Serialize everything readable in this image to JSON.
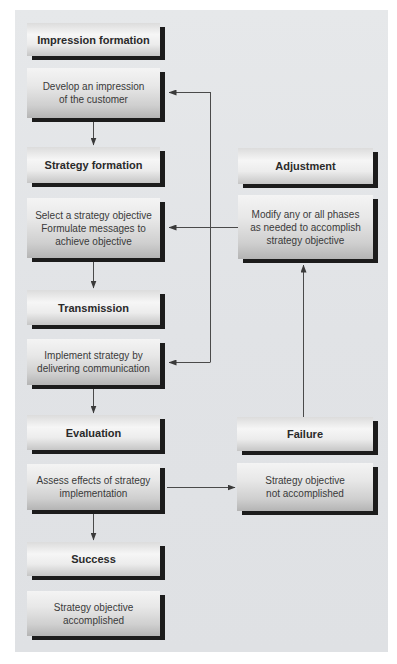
{
  "diagram": {
    "left_column": {
      "impression": {
        "header": "Impression formation",
        "body": "Develop an impression\nof the customer"
      },
      "strategy": {
        "header": "Strategy formation",
        "body": "Select a strategy objective\nFormulate messages to\nachieve objective"
      },
      "transmission": {
        "header": "Transmission",
        "body": "Implement strategy by\ndelivering communication"
      },
      "evaluation": {
        "header": "Evaluation",
        "body": "Assess effects of strategy\nimplementation"
      },
      "success": {
        "header": "Success",
        "body": "Strategy objective\naccomplished"
      }
    },
    "right_column": {
      "adjustment": {
        "header": "Adjustment",
        "body": "Modify any or all phases\nas needed to accomplish\nstrategy objective"
      },
      "failure": {
        "header": "Failure",
        "body": "Strategy objective\nnot accomplished"
      }
    },
    "colors": {
      "panel_background": "#e2e4e6",
      "box_shadow": "#1c1c1c",
      "connector": "#4a4a4a"
    }
  }
}
